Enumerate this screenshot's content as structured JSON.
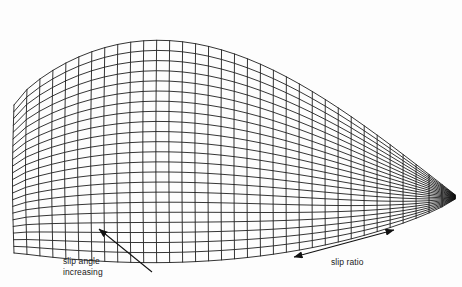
{
  "figure": {
    "type": "3d-wireframe-surface",
    "background_color": "#fdfdfd",
    "mesh_color": "#111111"
  },
  "annotations": {
    "slip_angle": {
      "line1": "slip angle",
      "line2": "increasing",
      "arrow_name": "slip-angle-arrow",
      "arrow_style": "single-headed",
      "arrow_direction": "up-left",
      "arrow_from": [
        152,
        272
      ],
      "arrow_to": [
        97,
        227
      ]
    },
    "slip_ratio": {
      "label": "slip ratio",
      "arrow_name": "slip-ratio-arrow",
      "arrow_style": "double-headed",
      "arrow_direction": "bidirectional-diagonal",
      "arrow_from": [
        292,
        258
      ],
      "arrow_to": [
        396,
        229
      ]
    }
  },
  "chart_data": {
    "type": "surface",
    "title": "",
    "xlabel": "slip ratio",
    "ylabel": "slip angle increasing",
    "zlabel": "",
    "grid": true,
    "legend": false,
    "u_divisions": 34,
    "v_divisions": 22,
    "surface_shape": "ridge-dome decaying to a point at the right"
  },
  "geometry": {
    "corner_near_left": [
      14,
      105
    ],
    "corner_apex_top": [
      200,
      5
    ],
    "corner_bottom": [
      200,
      250
    ],
    "corner_right_tip": [
      455,
      200
    ]
  }
}
